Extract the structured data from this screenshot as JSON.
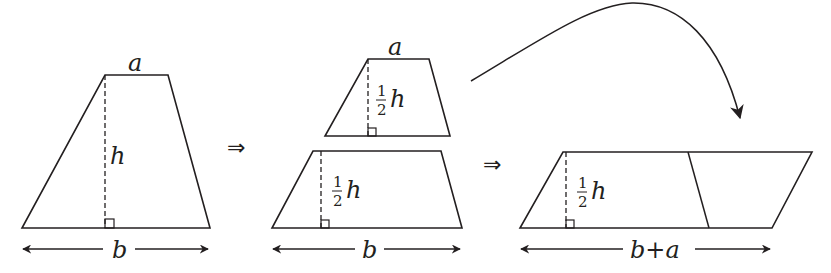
{
  "colors": {
    "stroke": "#231f20",
    "background": "#ffffff"
  },
  "figure1": {
    "top_label": "a",
    "height_label": "h",
    "base_label": "b"
  },
  "implies_1": "⇒",
  "figure2": {
    "top_piece": {
      "top_label": "a",
      "height_num": "1",
      "height_den": "2",
      "height_var": "h"
    },
    "bottom_piece": {
      "height_num": "1",
      "height_den": "2",
      "height_var": "h"
    },
    "base_label": "b"
  },
  "implies_2": "⇒",
  "figure3": {
    "height_num": "1",
    "height_den": "2",
    "height_var": "h",
    "base_label": "b+a"
  },
  "curved_arrow": {
    "icon": "curved-arrow-icon",
    "meaning": "move top piece to right side"
  }
}
